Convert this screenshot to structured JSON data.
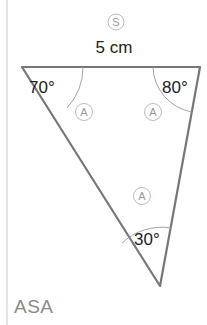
{
  "diagram": {
    "side_marker": "S",
    "side_length": "5 cm",
    "angles": {
      "top_left": "70°",
      "top_right": "80°",
      "bottom": "30°"
    },
    "angle_markers": [
      "A",
      "A",
      "A"
    ],
    "rule_label": "ASA"
  },
  "colors": {
    "triangle_stroke": "#777777",
    "text": "#222222",
    "marker": "#999999",
    "rule_label": "#8a8a8a"
  }
}
